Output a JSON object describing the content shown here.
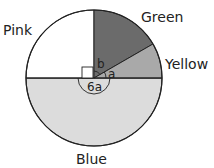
{
  "diagram": {
    "type": "pie",
    "colors": {
      "pink": "#ffffff",
      "green": "#6b6b6b",
      "yellow": "#a9a9a9",
      "blue": "#dcdcdc",
      "stroke": "#222222"
    },
    "labels": {
      "pink": "Pink",
      "green": "Green",
      "yellow": "Yellow",
      "blue": "Blue"
    },
    "angle_labels": {
      "b": "b",
      "a": "a",
      "six_a": "6a"
    },
    "sectors": [
      {
        "name": "Pink",
        "angle": "90° (right angle)"
      },
      {
        "name": "Green",
        "angle": "b"
      },
      {
        "name": "Yellow",
        "angle": "a"
      },
      {
        "name": "Blue",
        "angle": "6a"
      }
    ]
  }
}
